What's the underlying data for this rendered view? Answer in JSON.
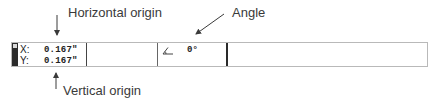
{
  "annotations": {
    "horizontal_origin": "Horizontal origin",
    "angle": "Angle",
    "vertical_origin": "Vertical origin"
  },
  "status_bar": {
    "x_label": "X:",
    "x_value": "0.167\"",
    "y_label": "Y:",
    "y_value": "0.167\"",
    "angle_icon": "angle-icon",
    "angle_value": "0°"
  },
  "colors": {
    "bar_border": "#b9b9b9",
    "grip": "#2b2b2b",
    "separator_dark": "#2a2a2a",
    "annotation_text": "#3a3a3a"
  }
}
